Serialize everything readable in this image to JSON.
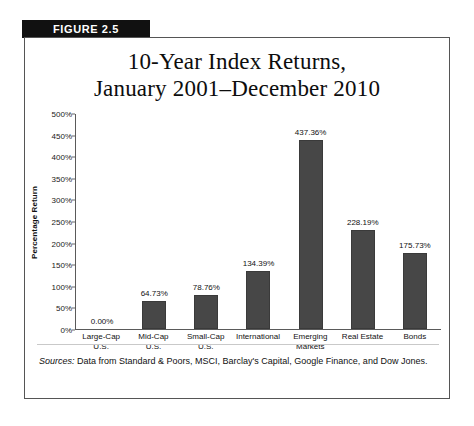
{
  "figure": {
    "banner_label": "FIGURE 2.5"
  },
  "sources": {
    "label": "Sources:",
    "text": " Data from Standard & Poors, MSCI, Barclay's Capital, Google Finance, and Dow Jones."
  },
  "chart_data": {
    "type": "bar",
    "title": "10-Year Index Returns, January 2001–December 2010",
    "title_lines": [
      "10-Year Index Returns,",
      "January 2001–December 2010"
    ],
    "xlabel": "",
    "ylabel": "Percentage Return",
    "ylim": [
      0,
      500
    ],
    "ytick_values": [
      0,
      50,
      100,
      150,
      200,
      250,
      300,
      350,
      400,
      450,
      500
    ],
    "ytick_labels": [
      "0%",
      "50%",
      "100%",
      "150%",
      "200%",
      "250%",
      "300%",
      "350%",
      "400%",
      "450%",
      "500%"
    ],
    "grid": false,
    "legend": false,
    "bar_color": "#474747",
    "categories": [
      "Large-Cap U.S.",
      "Mid-Cap U.S.",
      "Small-Cap U.S.",
      "International",
      "Emerging Markets",
      "Real Estate",
      "Bonds"
    ],
    "category_lines": [
      [
        "Large-Cap",
        "U.S."
      ],
      [
        "Mid-Cap",
        "U.S."
      ],
      [
        "Small-Cap",
        "U.S."
      ],
      [
        "International",
        ""
      ],
      [
        "Emerging",
        "Markets"
      ],
      [
        "Real Estate",
        ""
      ],
      [
        "Bonds",
        ""
      ]
    ],
    "values": [
      0.0,
      64.73,
      78.76,
      134.39,
      437.36,
      228.19,
      175.73
    ],
    "value_labels": [
      "0.00%",
      "64.73%",
      "78.76%",
      "134.39%",
      "437.36%",
      "228.19%",
      "175.73%"
    ]
  }
}
